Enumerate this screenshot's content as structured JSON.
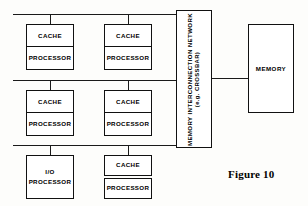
{
  "figure": {
    "caption": "Figure 10",
    "caption_x": 228,
    "caption_y": 168
  },
  "labels": {
    "cache": "CACHE",
    "processor": "PROCESSOR",
    "io": "I/O",
    "memory": "MEMORY",
    "network_line1": "MEMORY INTERCONNECTION NETWORK",
    "network_line2": "(e.g. CROSSBAR)"
  },
  "colors": {
    "ink": "#111111",
    "line": "#1a1a1a",
    "paper": "#fdfdfb",
    "box_fill": "#ffffff"
  },
  "buses": [
    {
      "name": "bus-top",
      "x": 13,
      "y": 14,
      "width": 163
    },
    {
      "name": "bus-middle",
      "x": 13,
      "y": 80,
      "width": 163
    },
    {
      "name": "bus-bottom",
      "x": 13,
      "y": 145,
      "width": 163
    }
  ],
  "stubs": [
    {
      "name": "stub-row1-left",
      "x": 50,
      "y": 14,
      "height": 10
    },
    {
      "name": "stub-row1-right",
      "x": 128,
      "y": 14,
      "height": 10
    },
    {
      "name": "stub-row2-left",
      "x": 50,
      "y": 80,
      "height": 10
    },
    {
      "name": "stub-row2-right",
      "x": 128,
      "y": 80,
      "height": 10
    },
    {
      "name": "stub-row3-left",
      "x": 50,
      "y": 145,
      "height": 10
    },
    {
      "name": "stub-row3-right",
      "x": 128,
      "y": 145,
      "height": 10
    }
  ],
  "units": [
    {
      "name": "unit-cache-processor-1",
      "type": "cache-processor",
      "x": 26,
      "y": 24,
      "width": 48,
      "height": 48,
      "top_label": "CACHE",
      "bottom_label": "PROCESSOR",
      "gap": false
    },
    {
      "name": "unit-cache-processor-2",
      "type": "cache-processor",
      "x": 104,
      "y": 24,
      "width": 48,
      "height": 48,
      "top_label": "CACHE",
      "bottom_label": "PROCESSOR",
      "gap": false
    },
    {
      "name": "unit-cache-processor-3",
      "type": "cache-processor",
      "x": 26,
      "y": 90,
      "width": 48,
      "height": 48,
      "top_label": "CACHE",
      "bottom_label": "PROCESSOR",
      "gap": false
    },
    {
      "name": "unit-cache-processor-4",
      "type": "cache-processor",
      "x": 104,
      "y": 90,
      "width": 48,
      "height": 48,
      "top_label": "CACHE",
      "bottom_label": "PROCESSOR",
      "gap": false
    },
    {
      "name": "unit-io-processor",
      "type": "io",
      "x": 26,
      "y": 155,
      "width": 48,
      "height": 44,
      "top_label": "I/O",
      "bottom_label": "PROCESSOR",
      "gap": false
    },
    {
      "name": "unit-cache-processor-5",
      "type": "cache-processor",
      "x": 104,
      "y": 155,
      "width": 48,
      "height": 44,
      "top_label": "CACHE",
      "bottom_label": "PROCESSOR",
      "gap": true
    }
  ],
  "network": {
    "x": 176,
    "y": 10,
    "width": 36,
    "height": 138
  },
  "memory": {
    "x": 248,
    "y": 24,
    "width": 46,
    "height": 89
  },
  "link": {
    "x": 212,
    "y": 78,
    "width": 36
  }
}
